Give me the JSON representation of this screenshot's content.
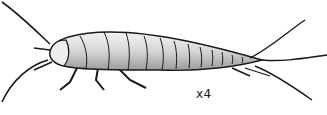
{
  "illustration": {
    "subject": "silverfish",
    "scale_label": "x4",
    "colors": {
      "outline": "#1a1a1a",
      "body_light": "#e6e6e6",
      "body_shade": "#a8a8a8",
      "background": "#ffffff"
    }
  }
}
